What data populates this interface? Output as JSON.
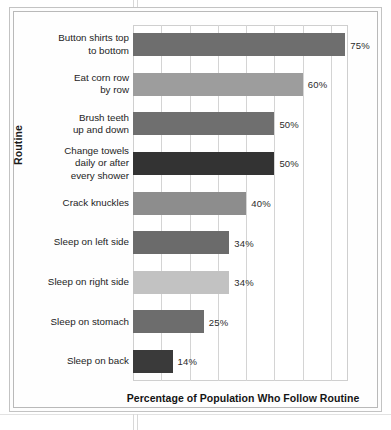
{
  "chart_data": {
    "type": "bar",
    "orientation": "horizontal",
    "title": "",
    "xlabel": "Percentage of Population Who Follow Routine",
    "ylabel": "Routine",
    "xlim": [
      0,
      76
    ],
    "grid": true,
    "legend": "none",
    "value_suffix": "%",
    "categories": [
      "Button shirts top\nto bottom",
      "Eat corn row\nby row",
      "Brush teeth\nup and down",
      "Change towels\ndaily or after\nevery shower",
      "Crack knuckles",
      "Sleep on left side",
      "Sleep on right side",
      "Sleep on stomach",
      "Sleep on back"
    ],
    "values": [
      75,
      60,
      50,
      50,
      40,
      34,
      34,
      25,
      14
    ],
    "value_labels": [
      "75%",
      "60%",
      "50%",
      "50%",
      "40%",
      "34%",
      "34%",
      "25%",
      "14%"
    ],
    "bar_colors": [
      "#6e6e6e",
      "#9d9d9d",
      "#6f6f6f",
      "#333333",
      "#8d8d8d",
      "#6b6b6b",
      "#c2c2c2",
      "#6d6d6d",
      "#3a3a3a"
    ],
    "gridline_positions": [
      10,
      20,
      30,
      40,
      50,
      60,
      70
    ],
    "colors": {
      "gridline": "#d4d4d4",
      "plot_border": "#cfcfcf",
      "frame": "#c3c3c3",
      "text": "#1d1d1d",
      "background": "#ffffff"
    }
  }
}
